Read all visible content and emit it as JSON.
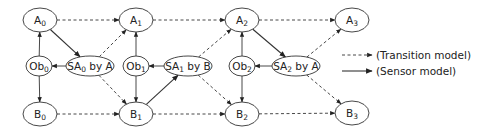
{
  "diagram": {
    "nodes": [
      {
        "id": "A0",
        "base": "A",
        "sub": "0",
        "suffix": "",
        "x": 40,
        "y": 20,
        "rx": 17,
        "ry": 12
      },
      {
        "id": "Ob0",
        "base": "Ob",
        "sub": "0",
        "suffix": "",
        "x": 39,
        "y": 66,
        "rx": 13,
        "ry": 10
      },
      {
        "id": "SA0",
        "base": "SA",
        "sub": "0",
        "suffix": " by A",
        "x": 90,
        "y": 66,
        "rx": 24,
        "ry": 10
      },
      {
        "id": "B0",
        "base": "B",
        "sub": "0",
        "suffix": "",
        "x": 40,
        "y": 114,
        "rx": 17,
        "ry": 12
      },
      {
        "id": "A1",
        "base": "A",
        "sub": "1",
        "suffix": "",
        "x": 136,
        "y": 20,
        "rx": 17,
        "ry": 12
      },
      {
        "id": "Ob1",
        "base": "Ob",
        "sub": "1",
        "suffix": "",
        "x": 136,
        "y": 66,
        "rx": 13,
        "ry": 10
      },
      {
        "id": "SA1",
        "base": "SA",
        "sub": "1",
        "suffix": " by B",
        "x": 188,
        "y": 66,
        "rx": 24,
        "ry": 10
      },
      {
        "id": "B1",
        "base": "B",
        "sub": "1",
        "suffix": "",
        "x": 136,
        "y": 114,
        "rx": 17,
        "ry": 12
      },
      {
        "id": "A2",
        "base": "A",
        "sub": "2",
        "suffix": "",
        "x": 242,
        "y": 20,
        "rx": 17,
        "ry": 12
      },
      {
        "id": "Ob2",
        "base": "Ob",
        "sub": "2",
        "suffix": "",
        "x": 242,
        "y": 66,
        "rx": 13,
        "ry": 10
      },
      {
        "id": "SA2",
        "base": "SA",
        "sub": "2",
        "suffix": " by A",
        "x": 296,
        "y": 66,
        "rx": 24,
        "ry": 10
      },
      {
        "id": "B2",
        "base": "B",
        "sub": "2",
        "suffix": "",
        "x": 242,
        "y": 114,
        "rx": 17,
        "ry": 12
      },
      {
        "id": "A3",
        "base": "A",
        "sub": "3",
        "suffix": "",
        "x": 352,
        "y": 20,
        "rx": 17,
        "ry": 12
      },
      {
        "id": "B3",
        "base": "B",
        "sub": "3",
        "suffix": "",
        "x": 352,
        "y": 113,
        "rx": 17,
        "ry": 12
      }
    ],
    "edges": [
      {
        "from": "A0",
        "to": "A1",
        "type": "transition"
      },
      {
        "from": "B0",
        "to": "B1",
        "type": "transition"
      },
      {
        "from": "SA0",
        "to": "A1",
        "type": "transition"
      },
      {
        "from": "SA0",
        "to": "B1",
        "type": "transition"
      },
      {
        "from": "A1",
        "to": "A2",
        "type": "transition"
      },
      {
        "from": "B1",
        "to": "B2",
        "type": "transition"
      },
      {
        "from": "SA1",
        "to": "A2",
        "type": "transition"
      },
      {
        "from": "SA1",
        "to": "B2",
        "type": "transition"
      },
      {
        "from": "A2",
        "to": "A3",
        "type": "transition"
      },
      {
        "from": "B2",
        "to": "B3",
        "type": "transition"
      },
      {
        "from": "SA2",
        "to": "A3",
        "type": "transition"
      },
      {
        "from": "SA2",
        "to": "B3",
        "type": "transition"
      },
      {
        "from": "A0",
        "to": "SA0",
        "type": "sensor"
      },
      {
        "from": "B1",
        "to": "SA1",
        "type": "sensor"
      },
      {
        "from": "A2",
        "to": "SA2",
        "type": "sensor"
      },
      {
        "from": "Ob0",
        "to": "A0",
        "type": "sensor-light"
      },
      {
        "from": "Ob0",
        "to": "B0",
        "type": "sensor-light"
      },
      {
        "from": "SA0",
        "to": "Ob0",
        "type": "sensor-light"
      },
      {
        "from": "Ob1",
        "to": "A1",
        "type": "sensor-light"
      },
      {
        "from": "Ob1",
        "to": "B1",
        "type": "sensor-light"
      },
      {
        "from": "SA1",
        "to": "Ob1",
        "type": "sensor-light"
      },
      {
        "from": "Ob2",
        "to": "A2",
        "type": "sensor-light"
      },
      {
        "from": "Ob2",
        "to": "B2",
        "type": "sensor-light"
      },
      {
        "from": "SA2",
        "to": "Ob2",
        "type": "sensor-light"
      }
    ]
  },
  "legend": {
    "transition_label": "(Transition model)",
    "sensor_label": "(Sensor model)"
  }
}
